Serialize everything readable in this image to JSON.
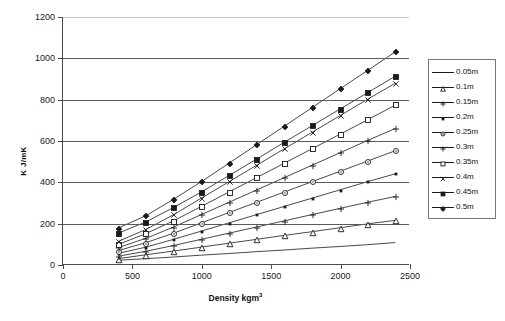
{
  "chart_data": {
    "type": "line",
    "title": "",
    "xlabel": "Density kgm",
    "xlabel_sup": "3",
    "ylabel": "K J/mK",
    "xlim": [
      0,
      2500
    ],
    "ylim": [
      0,
      1200
    ],
    "xticks": [
      0,
      500,
      1000,
      1500,
      2000,
      2500
    ],
    "yticks": [
      0,
      200,
      400,
      600,
      800,
      1000,
      1200
    ],
    "grid": "horizontal",
    "legend_position": "right",
    "x": [
      400,
      600,
      800,
      1000,
      1200,
      1400,
      1600,
      1800,
      2000,
      2200,
      2400
    ],
    "series": [
      {
        "name": "0.05m",
        "marker": "none",
        "values": [
          18,
          26,
          34,
          43,
          51,
          60,
          68,
          77,
          85,
          94,
          104
        ]
      },
      {
        "name": "0.1m",
        "marker": "triangle-open",
        "values": [
          26,
          45,
          63,
          82,
          101,
          120,
          139,
          157,
          176,
          195,
          212
        ]
      },
      {
        "name": "0.15m",
        "marker": "plus",
        "values": [
          38,
          62,
          90,
          120,
          150,
          180,
          210,
          240,
          270,
          300,
          328
        ]
      },
      {
        "name": "0.2m",
        "marker": "dot",
        "values": [
          52,
          82,
          120,
          160,
          200,
          240,
          280,
          320,
          360,
          400,
          438
        ]
      },
      {
        "name": "0.25m",
        "marker": "circle-open",
        "values": [
          65,
          104,
          150,
          200,
          250,
          300,
          350,
          400,
          450,
          500,
          550
        ]
      },
      {
        "name": "0.3m",
        "marker": "cross",
        "values": [
          80,
          125,
          180,
          240,
          300,
          360,
          420,
          480,
          540,
          600,
          658
        ]
      },
      {
        "name": "0.35m",
        "marker": "square-open",
        "values": [
          95,
          148,
          210,
          280,
          350,
          420,
          490,
          560,
          630,
          700,
          772
        ]
      },
      {
        "name": "0.4m",
        "marker": "x",
        "values": [
          110,
          168,
          240,
          320,
          400,
          480,
          560,
          640,
          720,
          800,
          878
        ]
      },
      {
        "name": "0.45m",
        "marker": "square-filled",
        "values": [
          150,
          205,
          275,
          350,
          430,
          510,
          592,
          672,
          752,
          832,
          912
        ]
      },
      {
        "name": "0.5m",
        "marker": "diamond-filled",
        "values": [
          175,
          235,
          315,
          400,
          490,
          580,
          670,
          760,
          850,
          940,
          1030
        ]
      }
    ]
  },
  "legend": {
    "items": [
      {
        "label": "0.05m"
      },
      {
        "label": "0.1m"
      },
      {
        "label": "0.15m"
      },
      {
        "label": "0.2m"
      },
      {
        "label": "0.25m"
      },
      {
        "label": "0.3m"
      },
      {
        "label": "0.35m"
      },
      {
        "label": "0.4m"
      },
      {
        "label": "0.45m"
      },
      {
        "label": "0.5m"
      }
    ]
  },
  "axes": {
    "y_title": "K J/mK",
    "x_title_main": "Density kgm",
    "x_title_sup": "3"
  },
  "caption": {
    "text": ""
  }
}
